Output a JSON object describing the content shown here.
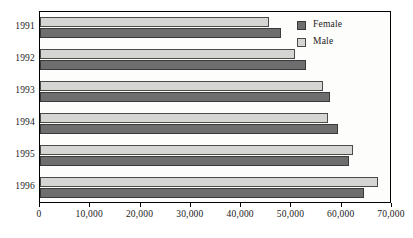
{
  "chart_data": {
    "type": "bar",
    "orientation": "horizontal",
    "title": "",
    "subtitle": "",
    "xlabel": "",
    "ylabel": "",
    "categories": [
      "1991",
      "1992",
      "1993",
      "1994",
      "1995",
      "1996"
    ],
    "series": [
      {
        "name": "Female",
        "color": "#6e6e6e",
        "values": [
          48000,
          52900,
          57600,
          59200,
          61500,
          64500
        ]
      },
      {
        "name": "Male",
        "color": "#d5d5d2",
        "values": [
          45500,
          50700,
          56200,
          57300,
          62200,
          67200
        ]
      }
    ],
    "xlim": [
      0,
      70000
    ],
    "xticks": [
      0,
      10000,
      20000,
      30000,
      40000,
      50000,
      60000,
      70000
    ],
    "xticklabels": [
      "0",
      "10,000",
      "20,000",
      "30,000",
      "40,000",
      "50,000",
      "60,000",
      "70,000"
    ],
    "grid": false,
    "legend": {
      "position": "top-right",
      "entries": [
        {
          "label": "Female",
          "color": "#6e6e6e"
        },
        {
          "label": "Male",
          "color": "#d5d5d2"
        }
      ]
    },
    "frame_color": "#000000",
    "background": "#ffffff"
  }
}
